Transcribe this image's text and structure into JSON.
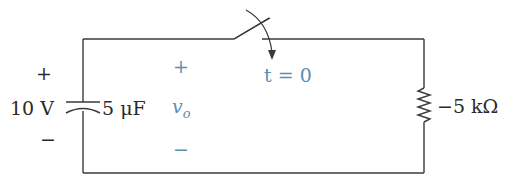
{
  "circuit": {
    "source": {
      "voltage_label": "10 V",
      "plus": "+",
      "minus": "−"
    },
    "capacitor": {
      "value_label": "5 μF"
    },
    "output": {
      "plus": "+",
      "minus": "−",
      "symbol": "v",
      "subscript": "o"
    },
    "switch": {
      "time_label": "t = 0"
    },
    "resistor": {
      "value_label": "−5 kΩ"
    },
    "colors": {
      "wire": "#3a3a3a",
      "text": "#2a2a2a",
      "accent": "#5a8fb0"
    }
  }
}
